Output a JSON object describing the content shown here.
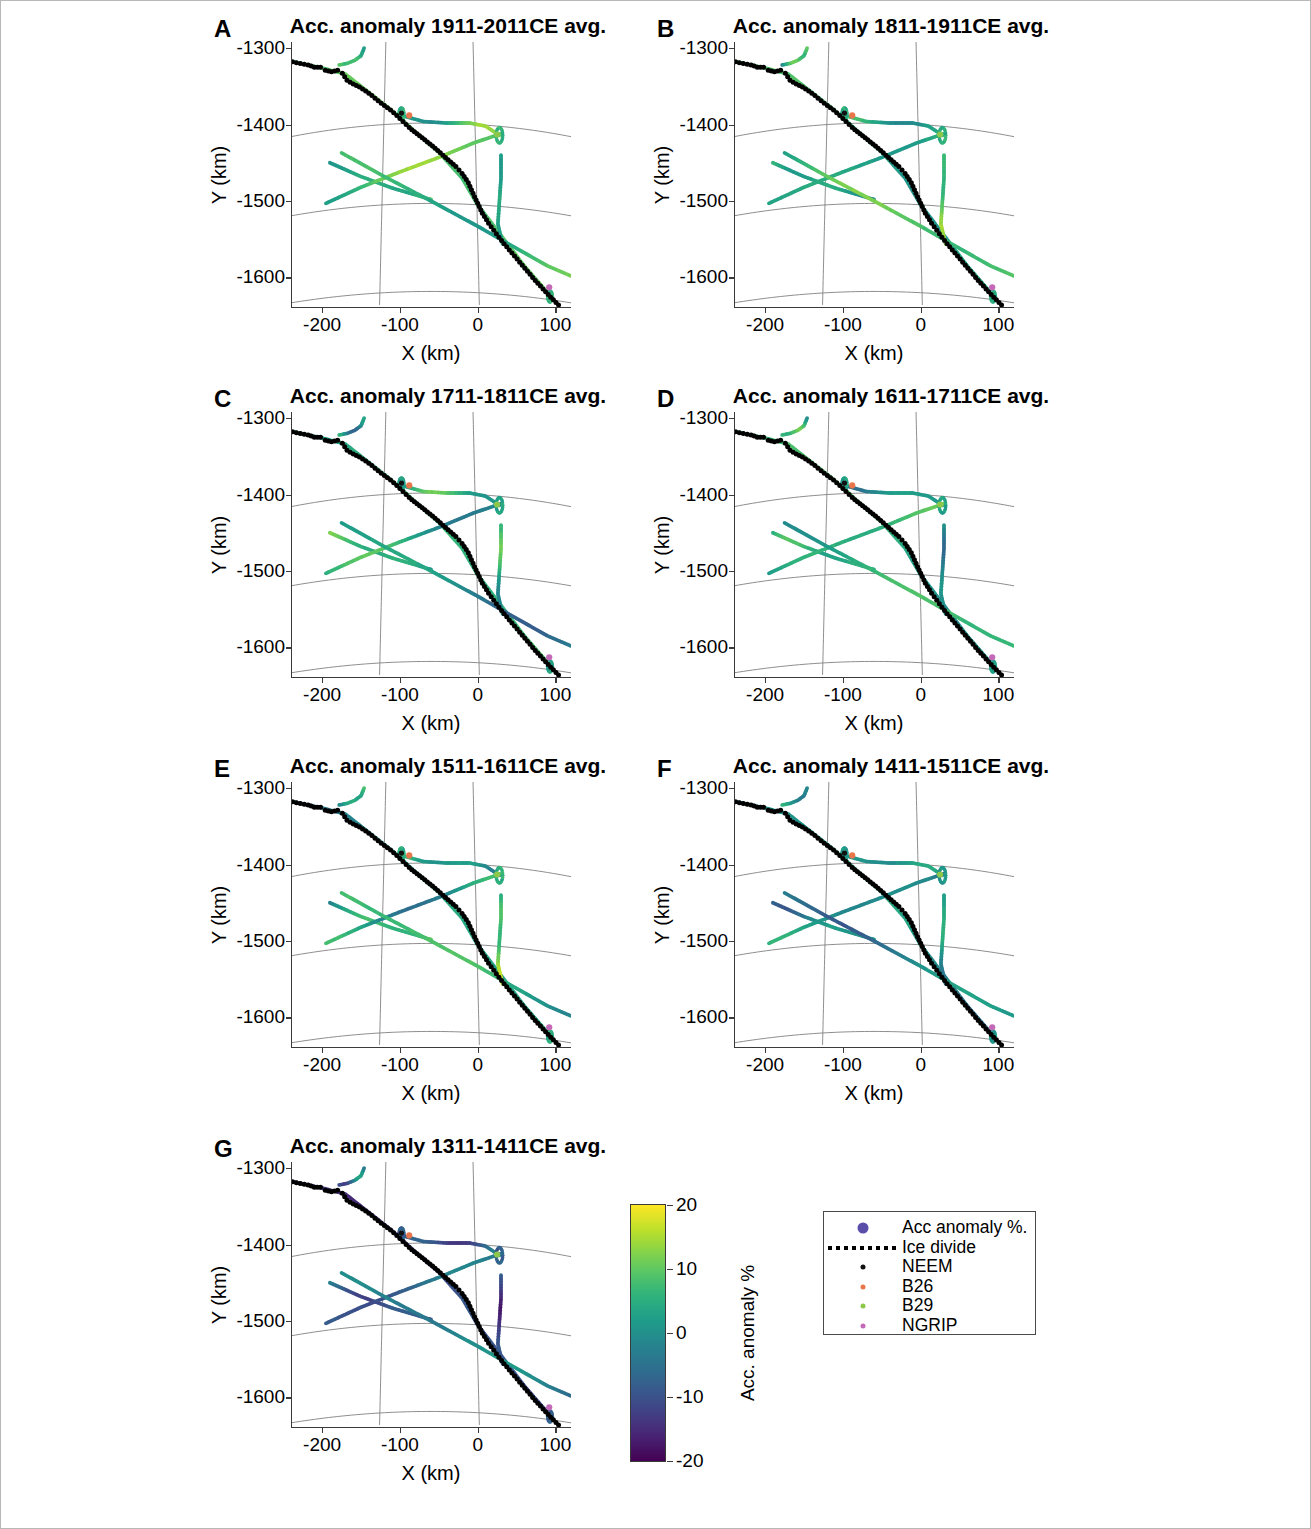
{
  "figure": {
    "axis": {
      "xlabel": "X (km)",
      "ylabel": "Y (km)",
      "xticks": [
        "-200",
        "-100",
        "0",
        "100"
      ],
      "xtick_values": [
        -200,
        -100,
        0,
        100
      ],
      "yticks": [
        "-1300",
        "-1400",
        "-1500",
        "-1600"
      ],
      "ytick_values": [
        -1300,
        -1400,
        -1500,
        -1600
      ],
      "xlim": [
        -240,
        120
      ],
      "ylim": [
        -1640,
        -1292
      ]
    },
    "panels": [
      {
        "letter": "A",
        "title": "Acc. anomaly 1911-2011CE avg.",
        "mean_anomaly": 6
      },
      {
        "letter": "B",
        "title": "Acc. anomaly 1811-1911CE avg.",
        "mean_anomaly": 5
      },
      {
        "letter": "C",
        "title": "Acc. anomaly 1711-1811CE avg.",
        "mean_anomaly": 3
      },
      {
        "letter": "D",
        "title": "Acc. anomaly 1611-1711CE avg.",
        "mean_anomaly": 3
      },
      {
        "letter": "E",
        "title": "Acc. anomaly 1511-1611CE avg.",
        "mean_anomaly": 5
      },
      {
        "letter": "F",
        "title": "Acc. anomaly 1411-1511CE avg.",
        "mean_anomaly": 1
      },
      {
        "letter": "G",
        "title": "Acc. anomaly 1311-1411CE avg.",
        "mean_anomaly": -8
      }
    ],
    "colorbar": {
      "title": "Acc. anomaly %",
      "ticks": [
        "20",
        "10",
        "0",
        "-10",
        "-20"
      ],
      "tick_values": [
        20,
        10,
        0,
        -10,
        -20
      ],
      "vmin": -20,
      "vmax": 20,
      "colormap": "viridis",
      "stops": [
        "#fde725",
        "#b5de2b",
        "#6ece58",
        "#35b779",
        "#1f9e89",
        "#26828e",
        "#31688e",
        "#3e4989",
        "#482878",
        "#440154"
      ]
    },
    "legend": {
      "items": [
        {
          "label": "Acc anomaly %.",
          "symbol": "large-dot",
          "color": "#5b4ea8"
        },
        {
          "label": "Ice divide",
          "symbol": "dotted-line",
          "color": "#000000"
        },
        {
          "label": "NEEM",
          "symbol": "small-dot",
          "color": "#111111"
        },
        {
          "label": "B26",
          "symbol": "small-dot",
          "color": "#e8764a"
        },
        {
          "label": "B29",
          "symbol": "small-dot",
          "color": "#8ec84a"
        },
        {
          "label": "NGRIP",
          "symbol": "small-dot",
          "color": "#c468b8"
        }
      ]
    }
  },
  "chart_data": {
    "type": "scatter",
    "xlabel": "X (km)",
    "ylabel": "Y (km)",
    "cbar_label": "Acc. anomaly %",
    "xlim": [
      -240,
      120
    ],
    "ylim": [
      -1640,
      -1292
    ],
    "clim": [
      -20,
      20
    ],
    "grid": "polar graticule (meridians and parallels)",
    "legend_position": "bottom-right, outside axes",
    "colormap": "viridis",
    "panel_anomaly_means": [
      {
        "panel": "A",
        "period": "1911-2011CE",
        "mean_anomaly_pct": 6
      },
      {
        "panel": "B",
        "period": "1811-1911CE",
        "mean_anomaly_pct": 5
      },
      {
        "panel": "C",
        "period": "1711-1811CE",
        "mean_anomaly_pct": 3
      },
      {
        "panel": "D",
        "period": "1611-1711CE",
        "mean_anomaly_pct": 3
      },
      {
        "panel": "E",
        "period": "1511-1611CE",
        "mean_anomaly_pct": 5
      },
      {
        "panel": "F",
        "period": "1411-1511CE",
        "mean_anomaly_pct": 1
      },
      {
        "panel": "G",
        "period": "1311-1411CE",
        "mean_anomaly_pct": -8
      }
    ],
    "ice_core_sites": [
      {
        "name": "NEEM",
        "x": -98,
        "y": -1385,
        "color": "#111111"
      },
      {
        "name": "B26",
        "x": -88,
        "y": -1388,
        "color": "#e8764a"
      },
      {
        "name": "B29",
        "x": 25,
        "y": -1413,
        "color": "#8ec84a"
      },
      {
        "name": "NGRIP",
        "x": 92,
        "y": -1613,
        "color": "#c468b8"
      }
    ],
    "ice_divide": {
      "label": "Ice divide",
      "style": "black dotted",
      "points": [
        [
          -238,
          -1318
        ],
        [
          -228,
          -1320
        ],
        [
          -218,
          -1322
        ],
        [
          -210,
          -1325
        ],
        [
          -202,
          -1325
        ],
        [
          -196,
          -1329
        ],
        [
          -188,
          -1331
        ],
        [
          -180,
          -1329
        ],
        [
          -174,
          -1333
        ],
        [
          -168,
          -1342
        ],
        [
          -160,
          -1347
        ],
        [
          -152,
          -1351
        ],
        [
          -144,
          -1356
        ],
        [
          -136,
          -1362
        ],
        [
          -128,
          -1369
        ],
        [
          -120,
          -1375
        ],
        [
          -112,
          -1381
        ],
        [
          -104,
          -1388
        ],
        [
          -96,
          -1396
        ],
        [
          -88,
          -1404
        ],
        [
          -78,
          -1412
        ],
        [
          -68,
          -1420
        ],
        [
          -58,
          -1428
        ],
        [
          -48,
          -1437
        ],
        [
          -38,
          -1446
        ],
        [
          -28,
          -1455
        ],
        [
          -20,
          -1464
        ],
        [
          -12,
          -1476
        ],
        [
          -6,
          -1490
        ],
        [
          0,
          -1503
        ],
        [
          6,
          -1516
        ],
        [
          14,
          -1529
        ],
        [
          24,
          -1543
        ],
        [
          34,
          -1556
        ],
        [
          44,
          -1568
        ],
        [
          54,
          -1580
        ],
        [
          64,
          -1592
        ],
        [
          74,
          -1604
        ],
        [
          84,
          -1615
        ],
        [
          94,
          -1626
        ],
        [
          104,
          -1636
        ]
      ]
    },
    "radar_tracks": [
      {
        "id": "track-north-loop",
        "points": [
          [
            -178,
            -1322
          ],
          [
            -168,
            -1320
          ],
          [
            -158,
            -1316
          ],
          [
            -150,
            -1310
          ],
          [
            -146,
            -1300
          ]
        ],
        "note": "short NW stub"
      },
      {
        "id": "track-main-divide",
        "points": [
          [
            -236,
            -1318
          ],
          [
            -200,
            -1326
          ],
          [
            -170,
            -1334
          ],
          [
            -140,
            -1358
          ],
          [
            -110,
            -1382
          ],
          [
            -80,
            -1410
          ],
          [
            -50,
            -1436
          ],
          [
            -20,
            -1470
          ],
          [
            0,
            -1505
          ],
          [
            30,
            -1545
          ],
          [
            60,
            -1585
          ],
          [
            90,
            -1620
          ]
        ],
        "note": "follows ice divide"
      },
      {
        "id": "track-neem-b29",
        "points": [
          [
            -98,
            -1388
          ],
          [
            -70,
            -1396
          ],
          [
            -40,
            -1398
          ],
          [
            -10,
            -1398
          ],
          [
            10,
            -1402
          ],
          [
            22,
            -1410
          ],
          [
            28,
            -1414
          ]
        ],
        "note": "NEEM to B29 line"
      },
      {
        "id": "track-se-diag-1",
        "points": [
          [
            -190,
            -1450
          ],
          [
            -150,
            -1468
          ],
          [
            -110,
            -1483
          ],
          [
            -80,
            -1492
          ],
          [
            -60,
            -1498
          ]
        ],
        "note": "SW short diagonal"
      },
      {
        "id": "track-se-diag-2",
        "points": [
          [
            -195,
            -1503
          ],
          [
            -150,
            -1482
          ],
          [
            -100,
            -1462
          ],
          [
            -50,
            -1443
          ],
          [
            -5,
            -1424
          ],
          [
            30,
            -1412
          ]
        ],
        "note": "SW to B29 diagonal"
      },
      {
        "id": "track-long-se",
        "points": [
          [
            -175,
            -1437
          ],
          [
            -120,
            -1468
          ],
          [
            -60,
            -1500
          ],
          [
            0,
            -1533
          ],
          [
            50,
            -1562
          ],
          [
            90,
            -1585
          ],
          [
            120,
            -1598
          ]
        ],
        "note": "long NW-SE transect"
      },
      {
        "id": "track-b29-south",
        "points": [
          [
            30,
            -1440
          ],
          [
            30,
            -1470
          ],
          [
            28,
            -1500
          ],
          [
            26,
            -1530
          ],
          [
            32,
            -1556
          ]
        ],
        "note": "short N-S near B29"
      }
    ],
    "graticule": {
      "meridians": 2,
      "parallels": 3,
      "color": "#7a7a7a"
    }
  }
}
